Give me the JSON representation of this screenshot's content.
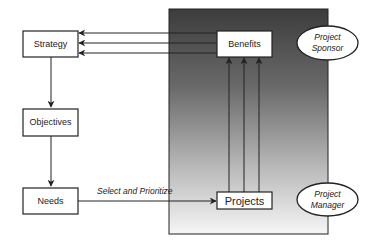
{
  "diagram": {
    "type": "flow-diagram",
    "left_column": {
      "strategy": "Strategy",
      "objectives": "Objectives",
      "needs": "Needs"
    },
    "panel": {
      "benefits": "Benefits",
      "projects": "Projects"
    },
    "connector_label": "Select and Prioritize",
    "roles": {
      "sponsor_line1": "Project",
      "sponsor_line2": "Sponsor",
      "manager_line1": "Project",
      "manager_line2": "Manager"
    },
    "colors": {
      "panel_top": "#3c3c3c",
      "panel_bottom": "#f6f6f6",
      "line": "#222222",
      "box_fill": "#ffffff"
    }
  }
}
